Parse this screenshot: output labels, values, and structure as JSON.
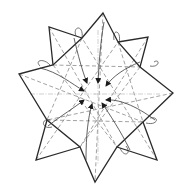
{
  "diagram": {
    "type": "origami-fold-step",
    "colors": {
      "background": "#ffffff",
      "outline": "#2a2a2a",
      "crease": "#8a8a8a",
      "arrow": "#3a3a3a"
    },
    "center": [
      92,
      88
    ],
    "front_outline": [
      [
        103,
        13
      ],
      [
        118,
        42
      ],
      [
        140,
        67
      ],
      [
        173,
        93
      ],
      [
        143,
        122
      ],
      [
        117,
        147
      ],
      [
        95,
        182
      ],
      [
        80,
        147
      ],
      [
        47,
        120
      ],
      [
        53,
        65
      ],
      [
        19,
        74
      ],
      [
        53,
        65
      ],
      [
        82,
        38
      ]
    ],
    "back_points": [
      {
        "tip": [
          49,
          27
        ],
        "base": [
          [
            53,
            65
          ],
          [
            82,
            38
          ]
        ]
      },
      {
        "tip": [
          148,
          37
        ],
        "base": [
          [
            118,
            42
          ],
          [
            140,
            67
          ]
        ]
      },
      {
        "tip": [
          157,
          160
        ],
        "base": [
          [
            143,
            122
          ],
          [
            117,
            147
          ]
        ]
      },
      {
        "tip": [
          36,
          160
        ],
        "base": [
          [
            47,
            120
          ],
          [
            80,
            147
          ]
        ]
      }
    ],
    "arrow_count": 8,
    "arrows_target": "center",
    "text_labels": []
  }
}
